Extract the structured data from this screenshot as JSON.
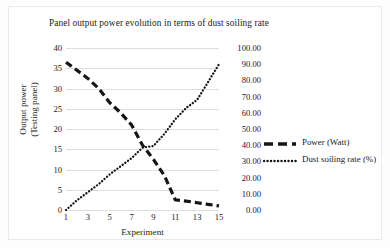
{
  "chart_data": {
    "type": "line",
    "title": "Panel output power evolution  in terms of dust soiling rate",
    "xlabel": "Experiment",
    "ylabel": "Output power (Testing panel)",
    "ylabel_lines": [
      "Output power",
      "(Testing panel)"
    ],
    "y2label": "",
    "grid": true,
    "legend_position": "right",
    "x": [
      1,
      2,
      3,
      4,
      5,
      6,
      7,
      8,
      9,
      10,
      11,
      12,
      13,
      14,
      15
    ],
    "xticks": [
      1,
      3,
      5,
      7,
      9,
      11,
      13,
      15
    ],
    "xtick_labels": [
      "1",
      "3",
      "5",
      "7",
      "9",
      "11",
      "13",
      "15"
    ],
    "xlim": [
      1,
      15
    ],
    "ylim": [
      0,
      40
    ],
    "yticks": [
      0,
      5,
      10,
      15,
      20,
      25,
      30,
      35,
      40
    ],
    "ytick_labels": [
      "0",
      "5",
      "10",
      "15",
      "20",
      "25",
      "30",
      "35",
      "40"
    ],
    "y2lim": [
      0,
      100
    ],
    "y2ticks": [
      0,
      10,
      20,
      30,
      40,
      50,
      60,
      70,
      80,
      90,
      100
    ],
    "y2tick_labels": [
      "0.00",
      "10.00",
      "20.00",
      "30.00",
      "40.00",
      "50.00",
      "60.00",
      "70.00",
      "80.00",
      "90.00",
      "100.00"
    ],
    "series": [
      {
        "name": "Power (Watt)",
        "axis": "left",
        "style": "dashed",
        "color": "#151515",
        "values": [
          36.5,
          34.5,
          32.5,
          30.0,
          26.5,
          24.0,
          21.0,
          16.0,
          12.5,
          8.5,
          2.5,
          2.2,
          1.8,
          1.4,
          1.0
        ]
      },
      {
        "name": "Dust soiling rate (%)",
        "axis": "right",
        "style": "dotted",
        "color": "#151515",
        "values": [
          0.0,
          6.0,
          11.0,
          16.0,
          22.0,
          27.0,
          32.0,
          38.5,
          39.5,
          47.0,
          56.0,
          63.0,
          68.0,
          79.0,
          90.0
        ]
      }
    ]
  },
  "legend": {
    "items": [
      {
        "label": "Power (Watt)",
        "style": "dashed"
      },
      {
        "label": "Dust soiling rate (%)",
        "style": "dotted"
      }
    ]
  }
}
